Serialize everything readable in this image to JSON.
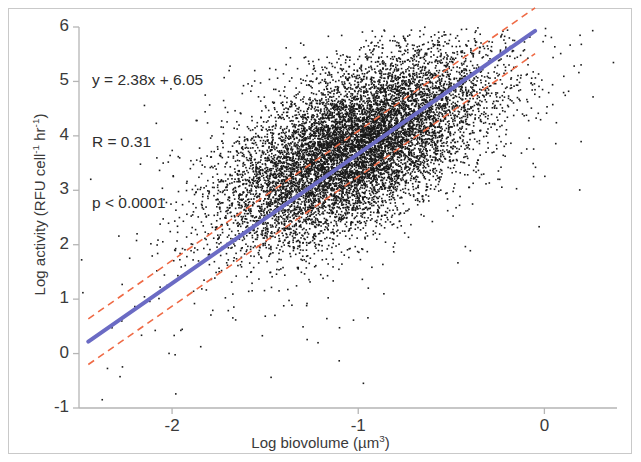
{
  "chart_data": {
    "type": "scatter",
    "title": "",
    "xlabel": "Log biovolume (µm³)",
    "ylabel": "Log activity (RFU cell⁻¹ hr⁻¹)",
    "xlabel_parts": {
      "prefix": "Log biovolume (µm",
      "sup": "3",
      "suffix": ")"
    },
    "ylabel_parts": {
      "p1": "Log activity (RFU cell",
      "s1": "-1",
      "p2": " hr",
      "s2": "-1",
      "p3": ")"
    },
    "xlim": [
      -2.5,
      0.39
    ],
    "ylim": [
      -1,
      6
    ],
    "xticks": [
      -2,
      -1,
      0
    ],
    "xtick_labels": [
      "-2",
      "-1",
      "0"
    ],
    "yticks": [
      -1,
      0,
      1,
      2,
      3,
      4,
      5,
      6
    ],
    "ytick_labels": [
      "-1",
      "0",
      "1",
      "2",
      "3",
      "4",
      "5",
      "6"
    ],
    "grid": false,
    "legend": "none",
    "point_color": "#1a1a1a",
    "point_count": 10000,
    "point_size": 1.6,
    "cloud": {
      "center_x": -1.02,
      "center_y": 3.78,
      "sd_x": 0.34,
      "sd_y": 0.72,
      "correlation": 0.31
    },
    "annotations": {
      "equation": "y = 2.38x + 6.05",
      "r_value": "R = 0.31",
      "p_value": "p < 0.0001"
    },
    "fit_line": {
      "name": "regression",
      "slope": 2.38,
      "intercept": 6.05,
      "color": "#6b6bc4",
      "style": "solid",
      "width": 4,
      "x_start": -2.45,
      "x_end": -0.05,
      "y_start": 0.22,
      "y_end": 5.93
    },
    "confidence_bands": [
      {
        "name": "upper-band",
        "color": "#ef6a45",
        "style": "dashed",
        "width": 1.6,
        "offset": 0.42,
        "x_start": -2.45,
        "x_end": -0.05
      },
      {
        "name": "lower-band",
        "color": "#ef6a45",
        "style": "dashed",
        "width": 1.6,
        "offset": -0.42,
        "x_start": -2.45,
        "x_end": -0.05
      }
    ],
    "axis_color": "#b5b5b5",
    "frame_color": "#c9c9c9",
    "background": "#ffffff"
  }
}
